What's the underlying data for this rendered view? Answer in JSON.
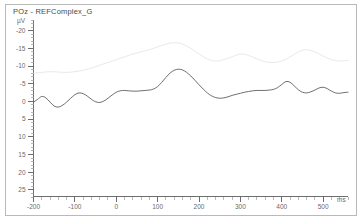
{
  "title": "POz - REFComplex_G",
  "chart_data": {
    "type": "line",
    "title": "POz - REFComplex_G",
    "xlabel": "ms",
    "ylabel": "µV",
    "y_unit": "µV",
    "x_unit": "ms",
    "xlim": [
      -200,
      560
    ],
    "ylim": [
      -23,
      27
    ],
    "y_axis_inverted": true,
    "grid": false,
    "legend": "none",
    "x_ticks": [
      -200,
      -100,
      0,
      100,
      200,
      300,
      400,
      500
    ],
    "x_tick_labels": [
      "-200",
      "-100",
      "0",
      "100",
      "200",
      "300",
      "400",
      "500"
    ],
    "x_minor_step": 20,
    "y_ticks": [
      -20,
      -15,
      -10,
      -5,
      0,
      5,
      10,
      15,
      20,
      25
    ],
    "y_tick_labels": [
      "-20",
      "-15",
      "-10",
      "-5",
      "0",
      "5",
      "10",
      "15",
      "20",
      "25"
    ],
    "y_minor_step": 1,
    "series": [
      {
        "name": "POz - REFComplex_G",
        "color": "#5d5d5d",
        "x": [
          -200,
          -190,
          -180,
          -170,
          -160,
          -150,
          -140,
          -130,
          -120,
          -110,
          -100,
          -90,
          -80,
          -70,
          -60,
          -50,
          -40,
          -30,
          -20,
          -10,
          0,
          10,
          20,
          30,
          40,
          50,
          60,
          70,
          80,
          90,
          100,
          110,
          120,
          130,
          140,
          150,
          160,
          170,
          180,
          190,
          200,
          210,
          220,
          230,
          240,
          250,
          260,
          270,
          280,
          290,
          300,
          310,
          320,
          330,
          340,
          350,
          360,
          370,
          380,
          390,
          400,
          410,
          420,
          430,
          440,
          450,
          460,
          470,
          480,
          490,
          500,
          510,
          520,
          530,
          540,
          550,
          560
        ],
        "y": [
          0.2,
          -0.6,
          -1.4,
          -1.0,
          0.2,
          1.3,
          1.6,
          1.1,
          0.2,
          -0.9,
          -1.9,
          -2.4,
          -2.2,
          -1.5,
          -0.6,
          0.1,
          0.3,
          -0.1,
          -0.9,
          -1.8,
          -2.6,
          -3.0,
          -3.1,
          -3.0,
          -2.9,
          -2.9,
          -3.0,
          -3.1,
          -3.2,
          -3.5,
          -4.2,
          -5.4,
          -6.8,
          -8.0,
          -8.8,
          -9.1,
          -8.9,
          -8.2,
          -7.2,
          -6.0,
          -4.7,
          -3.5,
          -2.4,
          -1.6,
          -1.1,
          -0.9,
          -1.0,
          -1.3,
          -1.7,
          -2.0,
          -2.3,
          -2.6,
          -2.8,
          -3.0,
          -3.1,
          -3.1,
          -3.1,
          -3.2,
          -3.4,
          -3.9,
          -4.8,
          -5.6,
          -5.4,
          -4.4,
          -3.3,
          -2.6,
          -2.4,
          -2.7,
          -3.2,
          -3.8,
          -4.0,
          -3.6,
          -2.9,
          -2.4,
          -2.3,
          -2.5,
          -2.6
        ],
        "peak_latency_ms": 150,
        "peak_amplitude_uv": -9.1
      },
      {
        "name": "overlay-trace",
        "color": "#e2e2e2",
        "x": [
          -200,
          -180,
          -160,
          -140,
          -120,
          -100,
          -80,
          -60,
          -40,
          -20,
          0,
          20,
          40,
          60,
          80,
          100,
          120,
          140,
          160,
          180,
          200,
          220,
          240,
          260,
          280,
          300,
          320,
          340,
          360,
          380,
          400,
          420,
          440,
          460,
          480,
          500,
          520,
          540,
          560
        ],
        "y": [
          -8.0,
          -8.2,
          -8.4,
          -8.3,
          -8.2,
          -8.4,
          -8.8,
          -9.4,
          -10.2,
          -11.0,
          -11.8,
          -12.6,
          -13.4,
          -14.0,
          -14.6,
          -15.4,
          -16.2,
          -16.6,
          -16.2,
          -15.0,
          -13.4,
          -12.0,
          -11.4,
          -11.8,
          -12.6,
          -13.4,
          -13.0,
          -12.0,
          -11.2,
          -11.0,
          -11.4,
          -12.6,
          -14.0,
          -14.6,
          -14.0,
          -12.8,
          -11.8,
          -11.4,
          -11.6
        ]
      }
    ]
  }
}
